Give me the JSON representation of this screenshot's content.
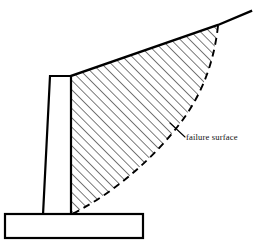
{
  "figure": {
    "background_color": "#ffffff",
    "line_color": "#000000",
    "hatch_color": "#1a1a1a",
    "annotations": [
      {
        "id": "failure-surface",
        "label": "failure surface",
        "text_x": 186,
        "text_y": 140,
        "leader_from_x": 170,
        "leader_from_y": 123,
        "leader_to_x": 185,
        "leader_to_y": 137
      }
    ],
    "geometry": {
      "base_slab": {
        "name": "base slab",
        "left": 5,
        "right": 143,
        "top": 214,
        "bottom": 238,
        "stroke_width": 2.2
      },
      "wall_stem": {
        "name": "wall stem",
        "top_left_x": 50,
        "top_left_y": 76,
        "top_right_x": 71,
        "top_right_y": 76,
        "bottom_right_x": 71,
        "bottom_right_y": 214,
        "bottom_left_x": 43,
        "bottom_left_y": 214,
        "stroke_width": 2.2
      },
      "ground_slope": {
        "name": "sloping backfill surface",
        "start_x": 71,
        "start_y": 76,
        "apex_x": 218,
        "apex_y": 25,
        "end_x": 251,
        "end_y": 11,
        "stroke_width": 2.4
      },
      "failure_surface": {
        "name": "failure surface curve",
        "dash_pattern": "7 5",
        "stroke_width": 1.9,
        "path": "M 218 26 C 214 62, 202 96, 178 126 C 158 152, 120 190, 72 214"
      },
      "hatch": {
        "name": "backfill hatching",
        "angle_degrees": 45,
        "spacing_px": 6.6,
        "stroke_width": 1.15
      }
    }
  }
}
